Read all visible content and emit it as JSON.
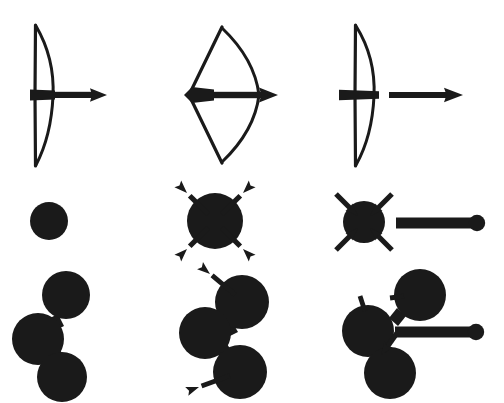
{
  "figure": {
    "title": "Bow-and-arrow and particle-cluster schematic diagram",
    "background_color": "#ffffff",
    "ink_color": "#1a1a1a",
    "columns": [
      {
        "id": "column-1",
        "label": "relaxed"
      },
      {
        "id": "column-2",
        "label": "loaded"
      },
      {
        "id": "column-3",
        "label": "released"
      }
    ],
    "rows": [
      {
        "id": "row-1",
        "label": "bow-and-arrow"
      },
      {
        "id": "row-2",
        "label": "single-disc"
      },
      {
        "id": "row-3",
        "label": "disc-chain"
      }
    ]
  },
  "panels": {
    "bow_relaxed": {
      "name": "relaxed bow with nocked arrow",
      "string_x": 35,
      "string_top_y": 25,
      "string_bottom_y": 166,
      "limb_bulge_x": 53,
      "arrow_y": 95,
      "arrow_nock_x": 30,
      "arrow_tip_x": 107
    },
    "bow_drawn": {
      "name": "fully drawn bow with nocked arrow",
      "string_apex_x": 189,
      "string_apex_y": 95,
      "tip_top_x": 222,
      "tip_top_y": 27,
      "tip_bottom_x": 222,
      "tip_bottom_y": 163,
      "limb_bulge_x": 259,
      "arrow_y": 95,
      "arrow_nock_x": 184,
      "arrow_tip_x": 278
    },
    "bow_released": {
      "name": "released bow with arrow in flight",
      "string_x": 355,
      "string_top_y": 25,
      "string_bottom_y": 166,
      "limb_bulge_x": 375,
      "nock_y": 95,
      "nock_left_x": 339,
      "nock_right_x": 379,
      "flight_arrow_start_x": 389,
      "flight_arrow_tip_x": 463,
      "flight_arrow_y": 95
    },
    "disc_plain": {
      "name": "single relaxed disc",
      "cx": 49,
      "cy": 221,
      "r": 19
    },
    "disc_expanding": {
      "name": "single disc with four outward arrows",
      "cx": 215,
      "cy": 221,
      "r": 28,
      "arrow_count": 4,
      "arrow_direction": "outward"
    },
    "disc_contracting": {
      "name": "single disc with four inward arrows plus detached rod",
      "cx": 364,
      "cy": 222,
      "r": 21,
      "arrow_count": 4,
      "arrow_direction": "inward",
      "rod_start_x": 396,
      "rod_end_x": 472,
      "rod_y": 223,
      "rod_knob_cx": 477,
      "rod_knob_r": 8
    },
    "chain_plain": {
      "name": "relaxed three-disc chain",
      "discs": [
        {
          "cx": 66,
          "cy": 295,
          "r": 24
        },
        {
          "cx": 38,
          "cy": 339,
          "r": 26
        },
        {
          "cx": 62,
          "cy": 377,
          "r": 25
        }
      ]
    },
    "chain_expanding": {
      "name": "three-disc chain with two outward arrows",
      "discs": [
        {
          "cx": 242,
          "cy": 302,
          "r": 27
        },
        {
          "cx": 205,
          "cy": 333,
          "r": 26
        },
        {
          "cx": 240,
          "cy": 372,
          "r": 27
        }
      ],
      "arrow_count": 2,
      "arrow_direction": "outward"
    },
    "chain_contracting": {
      "name": "three-disc chain with inward stub arrows plus detached rod",
      "discs": [
        {
          "cx": 420,
          "cy": 295,
          "r": 26
        },
        {
          "cx": 368,
          "cy": 331,
          "r": 26
        },
        {
          "cx": 390,
          "cy": 373,
          "r": 26
        }
      ],
      "arrow_count": 3,
      "arrow_direction": "inward",
      "rod_start_x": 395,
      "rod_end_x": 471,
      "rod_y": 332,
      "rod_knob_cx": 476,
      "rod_knob_r": 8
    }
  }
}
